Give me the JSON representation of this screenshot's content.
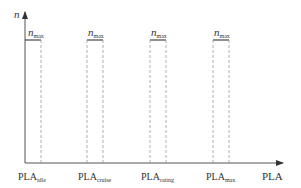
{
  "diagram": {
    "y_axis_label": "n",
    "x_axis_label": "PLA",
    "pulse_label_main": "n",
    "pulse_label_sub": "max",
    "pulses": [
      {
        "label_main": "PLA",
        "label_sub": "idle"
      },
      {
        "label_main": "PLA",
        "label_sub": "cruise"
      },
      {
        "label_main": "PLA",
        "label_sub": "rating"
      },
      {
        "label_main": "PLA",
        "label_sub": "max"
      }
    ],
    "colors": {
      "axis": "#555555",
      "pulse": "#444444",
      "dashed": "#999999",
      "text": "#333333"
    }
  }
}
